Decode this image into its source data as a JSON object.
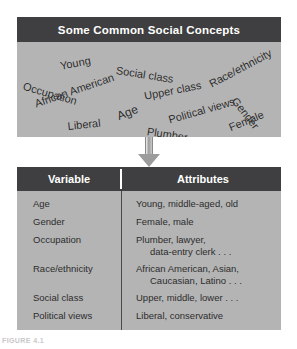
{
  "concepts_panel": {
    "title": "Some Common Social Concepts",
    "words": [
      {
        "text": "Young",
        "x": 42,
        "y": 18,
        "rotate": -11,
        "size": 11
      },
      {
        "text": "Social class",
        "x": 100,
        "y": 22,
        "rotate": 9,
        "size": 11
      },
      {
        "text": "Race/ethnicity",
        "x": 190,
        "y": 37,
        "rotate": -28,
        "size": 11
      },
      {
        "text": "Occupation",
        "x": 8,
        "y": 38,
        "rotate": 16,
        "size": 11
      },
      {
        "text": "Upper class",
        "x": 126,
        "y": 48,
        "rotate": -11,
        "size": 11
      },
      {
        "text": "Gender",
        "x": 222,
        "y": 53,
        "rotate": 52,
        "size": 11
      },
      {
        "text": "African American",
        "x": 16,
        "y": 56,
        "rotate": -19,
        "size": 11
      },
      {
        "text": "Age",
        "x": 98,
        "y": 68,
        "rotate": -22,
        "size": 12
      },
      {
        "text": "Political views",
        "x": 150,
        "y": 72,
        "rotate": -16,
        "size": 11
      },
      {
        "text": "Liberal",
        "x": 50,
        "y": 78,
        "rotate": -6,
        "size": 11
      },
      {
        "text": "Plumber",
        "x": 131,
        "y": 83,
        "rotate": 9,
        "size": 11
      },
      {
        "text": "Female",
        "x": 210,
        "y": 80,
        "rotate": -22,
        "size": 11
      }
    ]
  },
  "arrow": {
    "icon": "down-arrow-icon"
  },
  "variables_table": {
    "columns": [
      "Variable",
      "Attributes"
    ],
    "rows": [
      {
        "variable": "Age",
        "attributes": [
          "Young, middle-aged, old"
        ]
      },
      {
        "variable": "Gender",
        "attributes": [
          "Female, male"
        ]
      },
      {
        "variable": "Occupation",
        "attributes": [
          "Plumber, lawyer,",
          "data-entry clerk . . ."
        ]
      },
      {
        "variable": "Race/ethnicity",
        "attributes": [
          "African American, Asian,",
          "Caucasian, Latino . . ."
        ]
      },
      {
        "variable": "Social class",
        "attributes": [
          "Upper, middle, lower . . ."
        ]
      },
      {
        "variable": "Political views",
        "attributes": [
          "Liberal, conservative"
        ]
      }
    ]
  },
  "caption": {
    "text": "FIGURE 4.1"
  },
  "colors": {
    "header_bar": "#3f3f41",
    "panel_fill": "#b4b4b4",
    "text_dark": "#2d2d2d",
    "text_light": "#ffffff"
  }
}
